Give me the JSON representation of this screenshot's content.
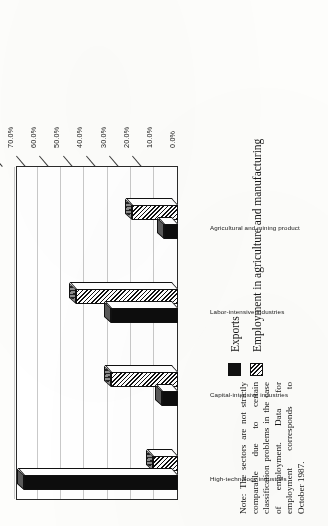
{
  "chart_data": {
    "type": "bar",
    "orientation": "vertical-3d",
    "title": "",
    "xlabel": "",
    "ylabel": "",
    "ylim": [
      0,
      70
    ],
    "grid": true,
    "legend_position": "below-right",
    "categories": [
      "High-technology industries",
      "Capital-intensive industries",
      "Labor-intensive industries",
      "Agricultural and mining product"
    ],
    "tick_labels": [
      "0.0%",
      "10.0%",
      "20.0%",
      "30.0%",
      "40.0%",
      "50.0%",
      "60.0%",
      "70.0%"
    ],
    "tick_values": [
      0,
      10,
      20,
      30,
      40,
      50,
      60,
      70
    ],
    "series": [
      {
        "name": "Exports",
        "pattern": "solid-black",
        "color": "#0d0d0d",
        "values": [
          66.5,
          7.0,
          29.0,
          6.0
        ]
      },
      {
        "name": "Employment in agriculture and manufacturing",
        "pattern": "diagonal-hatch",
        "color": "#111111",
        "values": [
          11.0,
          29.0,
          44.0,
          20.0
        ]
      }
    ]
  },
  "legend": {
    "items": [
      {
        "label": "Exports",
        "swatch": "solid"
      },
      {
        "label": "Employment in agriculture and manufacturing",
        "swatch": "hatch"
      }
    ]
  },
  "note": {
    "text": "Note: The sectors are not strictly comparable due to certain classification problems in the case of employment. Data for employment corresponds to October 1987."
  },
  "colors": {
    "ink": "#141414",
    "bar_solid": "#0d0d0d",
    "bar_top": "#5a5a5a",
    "gridline": "#c9c9c9",
    "axis": "#2b2b2b",
    "paper": "#fdfdfb"
  }
}
